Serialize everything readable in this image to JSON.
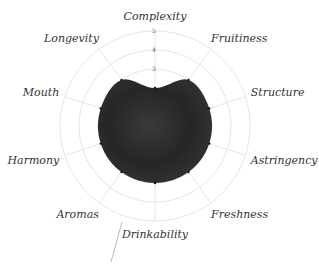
{
  "chart_data": {
    "type": "radar",
    "title": "",
    "categories": [
      "Complexity",
      "Fruitiness",
      "Structure",
      "Astringency",
      "Freshness",
      "Drinkability",
      "Aromas",
      "Harmony",
      "Mouth",
      "Longevity"
    ],
    "series": [
      {
        "name": "Wine profile",
        "values": [
          2,
          3,
          3,
          3,
          3,
          3,
          3,
          3,
          3,
          3
        ],
        "fill": "#2e2e2e"
      }
    ],
    "rlim": [
      0,
      5
    ],
    "rticks": [
      3,
      4,
      5
    ],
    "grid": true,
    "legend": "none"
  },
  "colors": {
    "grid": "#e6e6e6",
    "fill": "#2e2e2e",
    "label": "#333333"
  }
}
